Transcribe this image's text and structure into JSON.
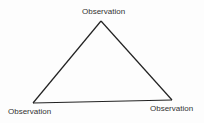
{
  "diagram": {
    "type": "triangle",
    "nodes": [
      {
        "id": "top",
        "label": "Observation"
      },
      {
        "id": "bottom-left",
        "label": "Observation"
      },
      {
        "id": "bottom-right",
        "label": "Observation"
      }
    ],
    "edges": [
      {
        "from": "top",
        "to": "bottom-left"
      },
      {
        "from": "bottom-left",
        "to": "bottom-right"
      },
      {
        "from": "bottom-right",
        "to": "top"
      }
    ],
    "line_color": "#222222"
  }
}
